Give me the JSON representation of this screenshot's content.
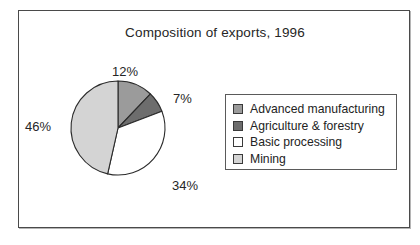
{
  "figure": {
    "title": "Composition of exports, 1996",
    "background": "#ffffff",
    "frame_color": "#4a4a4a"
  },
  "chart_data": {
    "type": "pie",
    "title": "Composition of exports, 1996",
    "xlabel": "",
    "ylabel": "",
    "units": "percent",
    "start_angle_deg": 0,
    "direction": "clockwise",
    "legend_position": "right",
    "grid": false,
    "categories": [
      "Advanced manufacturing",
      "Agriculture & forestry",
      "Basic processing",
      "Mining"
    ],
    "values": [
      12,
      7,
      34,
      46
    ],
    "labels": [
      "12%",
      "7%",
      "34%",
      "46%"
    ],
    "colors": [
      "#9b9b9b",
      "#6d6d6d",
      "#ffffff",
      "#d4d4d4"
    ],
    "slices": [
      {
        "name": "Advanced manufacturing",
        "value": 12,
        "label": "12%",
        "color": "#9b9b9b"
      },
      {
        "name": "Agriculture & forestry",
        "value": 7,
        "label": "7%",
        "color": "#6d6d6d"
      },
      {
        "name": "Basic processing",
        "value": 34,
        "label": "34%",
        "color": "#ffffff"
      },
      {
        "name": "Mining",
        "value": 46,
        "label": "46%",
        "color": "#d4d4d4"
      }
    ]
  },
  "legend": {
    "items": [
      {
        "label": "Advanced manufacturing",
        "color": "#9b9b9b"
      },
      {
        "label": "Agriculture & forestry",
        "color": "#6d6d6d"
      },
      {
        "label": "Basic processing",
        "color": "#ffffff"
      },
      {
        "label": "Mining",
        "color": "#d4d4d4"
      }
    ]
  }
}
